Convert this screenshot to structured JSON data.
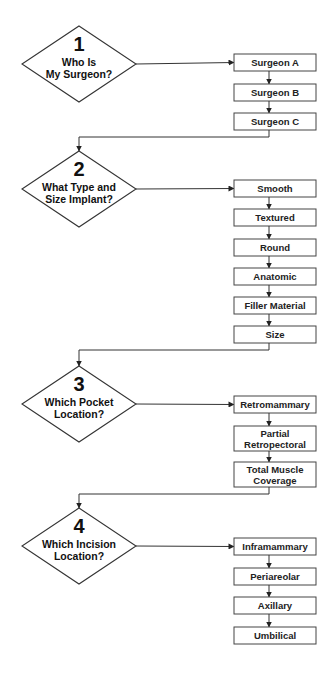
{
  "diagram": {
    "type": "flowchart",
    "colors": {
      "stroke": "#333333",
      "text": "#111111",
      "background": "#ffffff"
    },
    "steps": [
      {
        "number": "1",
        "question": [
          "Who Is",
          "My Surgeon?"
        ],
        "options": [
          [
            "Surgeon A"
          ],
          [
            "Surgeon B"
          ],
          [
            "Surgeon C"
          ]
        ]
      },
      {
        "number": "2",
        "question": [
          "What Type and",
          "Size Implant?"
        ],
        "options": [
          [
            "Smooth"
          ],
          [
            "Textured"
          ],
          [
            "Round"
          ],
          [
            "Anatomic"
          ],
          [
            "Filler Material"
          ],
          [
            "Size"
          ]
        ]
      },
      {
        "number": "3",
        "question": [
          "Which Pocket",
          "Location?"
        ],
        "options": [
          [
            "Retromammary"
          ],
          [
            "Partial",
            "Retropectoral"
          ],
          [
            "Total Muscle",
            "Coverage"
          ]
        ]
      },
      {
        "number": "4",
        "question": [
          "Which Incision",
          "Location?"
        ],
        "options": [
          [
            "Inframammary"
          ],
          [
            "Periareolar"
          ],
          [
            "Axillary"
          ],
          [
            "Umbilical"
          ]
        ]
      }
    ]
  }
}
